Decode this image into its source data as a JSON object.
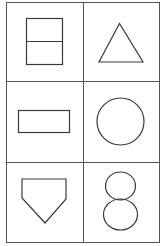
{
  "figure": {
    "title": "",
    "grid": {
      "rows": 3,
      "cols": 2
    },
    "colors": {
      "stroke": "#3a3a3a",
      "background": "#ffffff",
      "frame": "#555555"
    },
    "cells": [
      {
        "row": 0,
        "col": 0,
        "shape": "rectangle-divided-horizontally",
        "label": "square split into two halves"
      },
      {
        "row": 0,
        "col": 1,
        "shape": "triangle",
        "label": "triangle"
      },
      {
        "row": 1,
        "col": 0,
        "shape": "rectangle",
        "label": "horizontal rectangle"
      },
      {
        "row": 1,
        "col": 1,
        "shape": "circle",
        "label": "circle"
      },
      {
        "row": 2,
        "col": 0,
        "shape": "pentagon-shield",
        "label": "home-plate pentagon (pointing down)"
      },
      {
        "row": 2,
        "col": 1,
        "shape": "figure-eight",
        "label": "two stacked circles (figure eight)"
      }
    ]
  }
}
